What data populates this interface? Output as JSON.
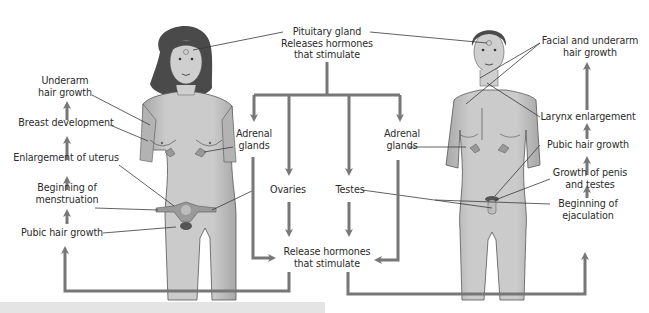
{
  "figure": {
    "title_top": {
      "line1": "Pituitary gland",
      "line2": "Releases hormones",
      "line3": "that stimulate"
    },
    "center": {
      "adrenal_left": {
        "line1": "Adrenal",
        "line2": "glands"
      },
      "adrenal_right": {
        "line1": "Adrenal",
        "line2": "glands"
      },
      "ovaries": "Ovaries",
      "testes": "Testes",
      "release": {
        "line1": "Release hormones",
        "line2": "that stimulate"
      }
    },
    "female": {
      "figure_label": "female-figure",
      "sequence": [
        {
          "line1": "Underarm",
          "line2": "hair growth"
        },
        {
          "line1": "Breast development"
        },
        {
          "line1": "Enlargement of uterus"
        },
        {
          "line1": "Beginning of",
          "line2": "menstruation"
        },
        {
          "line1": "Pubic hair growth"
        }
      ]
    },
    "male": {
      "figure_label": "male-figure",
      "sequence": [
        {
          "line1": "Facial and underarm",
          "line2": "hair growth"
        },
        {
          "line1": "Larynx enlargement"
        },
        {
          "line1": "Pubic hair growth"
        },
        {
          "line1": "Growth of penis",
          "line2": "and testes"
        },
        {
          "line1": "Beginning of",
          "line2": "ejaculation"
        }
      ]
    },
    "colors": {
      "arrow": "#777777",
      "leader_line": "#3a3a3a",
      "skin": "#c9c9c9",
      "skin_shadow": "#a9a9a9",
      "hair": "#4a4a4a",
      "text": "#2b2b2b",
      "caption_bar": "#e4e4e4"
    }
  }
}
